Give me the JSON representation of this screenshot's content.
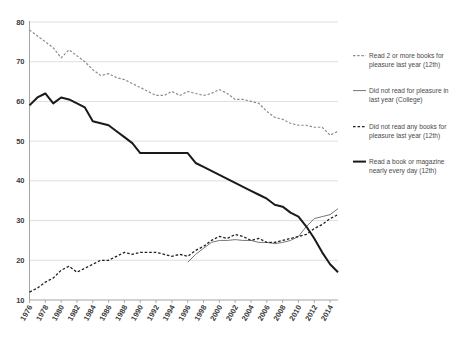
{
  "chart_data": {
    "type": "line",
    "title": "",
    "subtitle": "",
    "xlabel": "",
    "ylabel": "",
    "xlim": [
      1976,
      2015
    ],
    "ylim": [
      10,
      80
    ],
    "grid": true,
    "legend_position": "right",
    "y_ticks": [
      10,
      20,
      30,
      40,
      50,
      60,
      70,
      80
    ],
    "x_ticks": [
      "1976",
      "1978",
      "1980",
      "1982",
      "1984",
      "1986",
      "1988",
      "1990",
      "1992",
      "1994",
      "1996",
      "1998",
      "2000",
      "2002",
      "2004",
      "2006",
      "2008",
      "2010",
      "2012",
      "2014"
    ],
    "x": [
      1976,
      1977,
      1978,
      1979,
      1980,
      1981,
      1982,
      1983,
      1984,
      1985,
      1986,
      1987,
      1988,
      1989,
      1990,
      1991,
      1992,
      1993,
      1994,
      1995,
      1996,
      1997,
      1998,
      1999,
      2000,
      2001,
      2002,
      2003,
      2004,
      2005,
      2006,
      2007,
      2008,
      2009,
      2010,
      2011,
      2012,
      2013,
      2014,
      2015
    ],
    "series": [
      {
        "name": "Read 2 or more books for pleasure last year (12th)",
        "style": "dashed",
        "color": "#8c8c8c",
        "width": 1.2,
        "values": [
          78.0,
          76.5,
          75.0,
          73.5,
          71.0,
          73.0,
          71.5,
          70.0,
          68.0,
          66.5,
          67.0,
          66.0,
          65.5,
          64.5,
          63.5,
          62.5,
          61.5,
          61.5,
          62.5,
          61.5,
          62.5,
          62.0,
          61.5,
          62.0,
          63.0,
          62.0,
          60.5,
          60.5,
          60.0,
          59.5,
          57.5,
          56.0,
          55.5,
          54.5,
          54.0,
          54.0,
          53.5,
          53.5,
          51.5,
          52.5
        ]
      },
      {
        "name": "Did not read for pleasure in last year (College)",
        "style": "solid",
        "color": "#767676",
        "width": 1.0,
        "values": [
          null,
          null,
          null,
          null,
          null,
          null,
          null,
          null,
          null,
          null,
          null,
          null,
          null,
          null,
          null,
          null,
          null,
          null,
          null,
          null,
          19.5,
          21.5,
          23.0,
          24.5,
          25.0,
          25.0,
          25.2,
          25.0,
          25.0,
          24.5,
          24.5,
          24.2,
          24.5,
          25.0,
          26.0,
          28.5,
          30.5,
          31.0,
          31.5,
          33.0
        ]
      },
      {
        "name": "Did not read any books for pleasure last year (12th)",
        "style": "dashed",
        "color": "#1f1f1f",
        "width": 1.3,
        "values": [
          12.0,
          13.0,
          14.5,
          15.5,
          17.5,
          18.5,
          17.0,
          18.0,
          19.0,
          20.0,
          20.0,
          21.0,
          22.0,
          21.5,
          22.0,
          22.0,
          22.0,
          21.5,
          21.0,
          21.5,
          21.0,
          22.5,
          23.5,
          25.0,
          26.0,
          25.5,
          26.5,
          26.0,
          25.0,
          25.5,
          24.5,
          24.5,
          25.0,
          25.5,
          26.0,
          26.5,
          28.0,
          29.0,
          30.5,
          31.5
        ]
      },
      {
        "name": "Read a book or magazine nearly every day (12th)",
        "style": "solid",
        "color": "#1a1a1a",
        "width": 2.0,
        "values": [
          59.0,
          61.0,
          62.0,
          59.5,
          61.0,
          60.5,
          59.5,
          58.5,
          55.0,
          54.5,
          54.0,
          52.5,
          51.0,
          49.5,
          47.0,
          47.0,
          47.0,
          47.0,
          47.0,
          47.0,
          47.0,
          44.5,
          43.5,
          42.5,
          41.5,
          40.5,
          39.5,
          38.5,
          37.5,
          36.5,
          35.5,
          34.0,
          33.5,
          32.0,
          31.0,
          28.5,
          25.5,
          22.0,
          19.0,
          17.0
        ]
      }
    ],
    "legend_items": [
      {
        "label_line1": "Read 2 or more books for",
        "label_line2": "pleasure last year (12th)",
        "style": "dashed",
        "color": "#8c8c8c"
      },
      {
        "label_line1": "Did not read for pleasure in",
        "label_line2": "last year (College)",
        "style": "solid",
        "color": "#767676"
      },
      {
        "label_line1": "Did not read any books for",
        "label_line2": "pleasure last year (12th)",
        "style": "dashed",
        "color": "#1f1f1f"
      },
      {
        "label_line1": "Read a book or magazine",
        "label_line2": "nearly every day (12th)",
        "style": "solid",
        "color": "#1a1a1a"
      }
    ]
  }
}
